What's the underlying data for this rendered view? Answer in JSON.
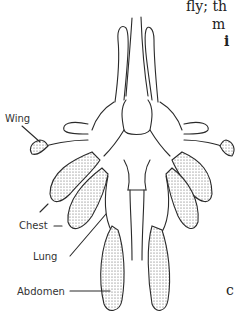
{
  "page_fragments": [
    {
      "text": "fly; th",
      "x": 186,
      "y": 0
    },
    {
      "text": "m",
      "x": 212,
      "y": 18
    },
    {
      "text": "i",
      "x": 224,
      "y": 35
    },
    {
      "text": "c",
      "x": 226,
      "y": 285
    }
  ],
  "diagram": {
    "labels": {
      "wing": "Wing",
      "chest": "Chest",
      "lung": "Lung",
      "abdomen": "Abdomen"
    }
  },
  "colors": {
    "ink": "#2a2a2a",
    "background": "#ffffff"
  }
}
